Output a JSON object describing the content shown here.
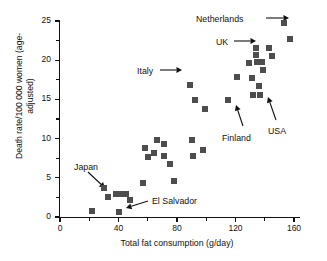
{
  "chart_data": {
    "type": "scatter",
    "title": "",
    "xlabel": "Total fat consumption (g/day)",
    "ylabel": "Death rate/100 000 women (age-adjusted)",
    "xlim": [
      0,
      170
    ],
    "ylim": [
      0,
      25
    ],
    "xticks": [
      0,
      40,
      80,
      120,
      160
    ],
    "xticklabels": [
      "0",
      "40",
      "80",
      "120",
      "160"
    ],
    "xminorticks": [
      20,
      60,
      100,
      140
    ],
    "yticks": [
      0,
      5,
      10,
      15,
      20,
      25
    ],
    "yticklabels": [
      "0",
      "5",
      "10",
      "15",
      "20",
      "25"
    ],
    "yminorticks": [
      2.5,
      7.5,
      12.5,
      17.5,
      22.5
    ],
    "grid": false,
    "legend": null,
    "marker": "square",
    "marker_color": "#4d4d4d",
    "points": [
      {
        "x": 22,
        "y": 0.8
      },
      {
        "x": 30,
        "y": 3.7
      },
      {
        "x": 33,
        "y": 2.5
      },
      {
        "x": 38,
        "y": 2.9
      },
      {
        "x": 40,
        "y": 0.7
      },
      {
        "x": 41,
        "y": 2.9
      },
      {
        "x": 45,
        "y": 2.9
      },
      {
        "x": 48,
        "y": 2.2
      },
      {
        "x": 57,
        "y": 4.4
      },
      {
        "x": 58,
        "y": 8.8
      },
      {
        "x": 60,
        "y": 7.6
      },
      {
        "x": 64,
        "y": 8.2
      },
      {
        "x": 66,
        "y": 9.8
      },
      {
        "x": 71,
        "y": 9.3
      },
      {
        "x": 71,
        "y": 7.8
      },
      {
        "x": 75,
        "y": 6.8
      },
      {
        "x": 78,
        "y": 4.6
      },
      {
        "x": 89,
        "y": 16.8
      },
      {
        "x": 90,
        "y": 9.8
      },
      {
        "x": 91,
        "y": 7.8
      },
      {
        "x": 92,
        "y": 14.9
      },
      {
        "x": 98,
        "y": 8.5
      },
      {
        "x": 99,
        "y": 13.8
      },
      {
        "x": 115,
        "y": 14.9
      },
      {
        "x": 121,
        "y": 17.8
      },
      {
        "x": 129,
        "y": 19.7
      },
      {
        "x": 131,
        "y": 17.7
      },
      {
        "x": 132,
        "y": 15.6
      },
      {
        "x": 134,
        "y": 21.6
      },
      {
        "x": 134,
        "y": 20.6
      },
      {
        "x": 135,
        "y": 19.8
      },
      {
        "x": 136,
        "y": 16.7
      },
      {
        "x": 137,
        "y": 15.6
      },
      {
        "x": 138,
        "y": 19.8
      },
      {
        "x": 139,
        "y": 18.7
      },
      {
        "x": 143,
        "y": 21.6
      },
      {
        "x": 145,
        "y": 20.5
      },
      {
        "x": 153,
        "y": 24.7
      },
      {
        "x": 157,
        "y": 22.7
      }
    ],
    "annotations": [
      {
        "label": "Netherlands",
        "points_to": {
          "x": 153,
          "y": 24.7
        }
      },
      {
        "label": "UK",
        "points_to": {
          "x": 134,
          "y": 21.6
        }
      },
      {
        "label": "Italy",
        "points_to": {
          "x": 89,
          "y": 16.8
        }
      },
      {
        "label": "USA",
        "points_to": {
          "x": 145,
          "y": 20.5
        }
      },
      {
        "label": "Finland",
        "points_to": {
          "x": 115,
          "y": 14.9
        }
      },
      {
        "label": "Japan",
        "points_to": {
          "x": 30,
          "y": 3.7
        }
      },
      {
        "label": "El Salvador",
        "points_to": {
          "x": 40,
          "y": 0.7
        }
      }
    ]
  }
}
